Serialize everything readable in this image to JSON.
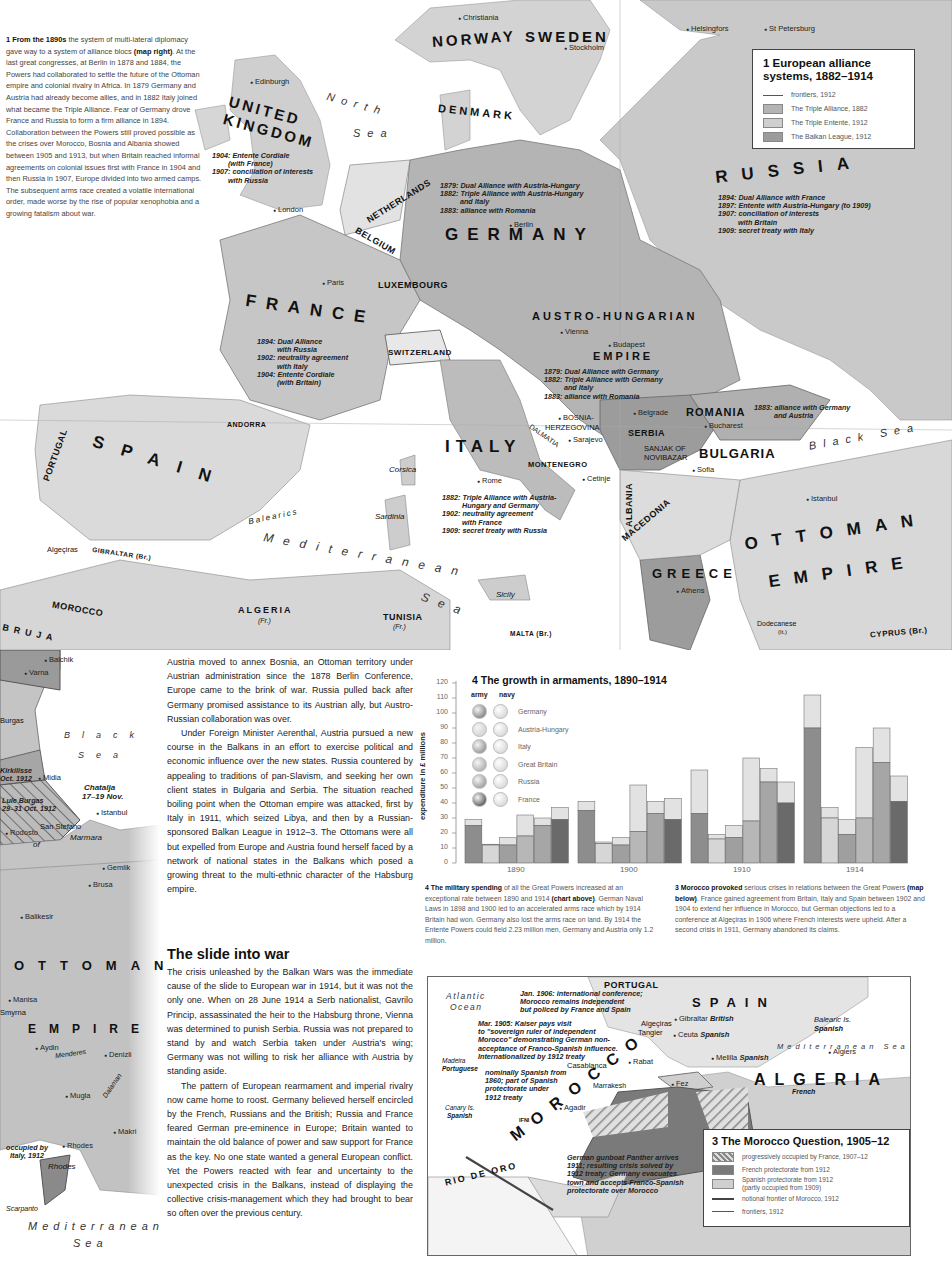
{
  "intro_panel": {
    "lead_bold": "1 From the 1890s",
    "text_1": " the system of multi-lateral diplomacy gave way to a system of alliance blocs ",
    "ref_bold": "(map right)",
    "text_2": ". At the last great congresses, at Berlin in 1878 and 1884, the Powers had collaborated to settle the future of the Ottoman empire and colonial rivalry in Africa. In 1879 Germany and Austria had already become allies, and in 1882 Italy joined what became the Triple Alliance. Fear of Germany drove France and Russia to form a firm alliance in 1894. Collaboration between the Powers still proved possible as the crises over Morocco, Bosnia and Albania showed between 1905 and 1913, but when Britain reached informal agreements on colonial issues first with France in 1904 and then Russia in 1907, Europe divided into two armed camps. The subsequent arms race created a volatile international order, made worse by the rise of popular xenophobia and a growing fatalism about war."
  },
  "map1": {
    "legend": {
      "title_line1": "1 European alliance",
      "title_line2": "systems, 1882–1914",
      "items": [
        {
          "label": "frontiers, 1912",
          "type": "line"
        },
        {
          "label": "The Triple Alliance, 1882",
          "color": "#b4b4b4"
        },
        {
          "label": "The Triple Entente, 1912",
          "color": "#cfcfcf"
        },
        {
          "label": "The Balkan League, 1912",
          "color": "#9c9c9c"
        }
      ]
    },
    "countries": {
      "norway": "NORWAY",
      "sweden": "SWEDEN",
      "denmark": "DENMARK",
      "uk1": "UNITED",
      "uk2": "KINGDOM",
      "netherlands": "NETHERLANDS",
      "belgium": "BELGIUM",
      "luxembourg": "LUXEMBOURG",
      "germany": "GERMANY",
      "russia": "RUSSIA",
      "france": "FRANCE",
      "switzerland": "SWITZERLAND",
      "austria1": "AUSTRO-HUNGARIAN",
      "austria2": "EMPIRE",
      "romania": "ROMANIA",
      "serbia": "SERBIA",
      "bulgaria": "BULGARIA",
      "montenegro": "MONTENEGRO",
      "bosnia1": "BOSNIA-",
      "bosnia2": "HERZEGOVINA",
      "sanjak1": "SANJAK OF",
      "sanjak2": "NOVIBAZAR",
      "dalmatia": "DALMATIA",
      "andorra": "ANDORRA",
      "portugal": "PORTUGAL",
      "spain": "SPAIN",
      "italy": "ITALY",
      "albania": "ALBANIA",
      "macedonia": "MACEDONIA",
      "greece": "GREECE",
      "ottoman1": "OTTOMAN",
      "ottoman2": "EMPIRE",
      "morocco": "MOROCCO",
      "algeria": "ALGERIA",
      "algeria_sub": "(Fr.)",
      "tunisia": "TUNISIA",
      "tunisia_sub": "(Fr.)",
      "gibraltar": "GIBRALTAR (Br.)",
      "malta": "MALTA (Br.)",
      "cyprus": "CYPRUS (Br.)",
      "dodecanese": "Dodecanese",
      "dodecanese_sub": "(It.)"
    },
    "cities": {
      "christiania": "Christiania",
      "stockholm": "Stockholm",
      "helsingfors": "Helsingfors",
      "st_petersburg": "St Petersburg",
      "edinburgh": "Edinburgh",
      "london": "London",
      "paris": "Paris",
      "berlin": "Berlin",
      "vienna": "Vienna",
      "budapest": "Budapest",
      "belgrade": "Belgrade",
      "bucharest": "Bucharest",
      "sarajevo": "Sarajevo",
      "sofia": "Sofia",
      "cetinje": "Cetinje",
      "rome": "Rome",
      "istanbul": "Istanbul",
      "athens": "Athens",
      "algeciras": "Algeçiras"
    },
    "islands": {
      "corsica": "Corsica",
      "sardinia": "Sardinia",
      "sicily": "Sicily",
      "balearics": "Balearics"
    },
    "seas": {
      "north1": "North",
      "north2": "Sea",
      "black": "Black Sea",
      "med1": "Mediterranean",
      "med2": "Sea"
    },
    "notes": {
      "uk": [
        "1904: Entente Cordiale",
        "        (with France)",
        "1907: conciliation of interests",
        "        with Russia"
      ],
      "germany": [
        "1879: Dual Alliance with Austria-Hungary",
        "1882: Triple Alliance with Austria-Hungary",
        "          and Italy",
        "1883: alliance with Romania"
      ],
      "russia": [
        "1894: Dual Alliance with France",
        "1897: Entente with Austria-Hungary (to 1909)",
        "1907: conciliation of interests",
        "          with Britain",
        "1909: secret treaty with Italy"
      ],
      "france": [
        "1894: Dual Alliance",
        "          with Russia",
        "1902: neutrality agreement",
        "          with Italy",
        "1904: Entente Cordiale",
        "          (with Britain)"
      ],
      "austria": [
        "1879: Dual Alliance with Germany",
        "1882: Triple Alliance with Germany",
        "          and Italy",
        "1883: alliance with Romania"
      ],
      "romania": [
        "1883: alliance with Germany",
        "          and Austria"
      ],
      "italy": [
        "1882: Triple Alliance with Austria-",
        "          Hungary and Germany",
        "1902: neutrality agreement",
        "          with France",
        "1909: secret treaty with Russia"
      ]
    }
  },
  "map2": {
    "labels": {
      "dobruja": "BRUJA",
      "balchik": "Balchik",
      "varna": "Varna",
      "burgas": "Burgas",
      "black1": "Black",
      "black2": "Sea",
      "kirkilisse": "Kirkilisse",
      "kirk_date": "Oct. 1912",
      "midia": "Midia",
      "chatalja1": "Chatalja",
      "chatalja2": "17–19 Nov.",
      "lule1": "Lule Burgas",
      "lule2": "29–31 Oct. 1912",
      "rodosto": "Rodosto",
      "san_stefano": "San Stefano",
      "istanbul": "Istanbul",
      "marmara": "Marmara",
      "of": "of",
      "gemlik": "Gemlik",
      "brusa": "Brusa",
      "balikesir": "Balikesir",
      "ottoman": "OTTOMAN",
      "manisa": "Manisa",
      "smyrna": "Smyrna",
      "empire": "EMPIRE",
      "aydin": "Aydin",
      "menderes": "Menderes",
      "denizli": "Denizli",
      "mugla": "Mugla",
      "dalaman": "Dalaman",
      "makri": "Makri",
      "rhodes_town": "Rhodes",
      "rhodes_island": "Rhodes",
      "occ1": "occupied by",
      "occ2": "Italy, 1912",
      "scarpanto": "Scarpanto",
      "med1": "Mediterranean",
      "med2": "Sea"
    }
  },
  "main_text": {
    "p1": "Austria moved to annex Bosnia, an Ottoman territory under Austrian administration since the 1878 Berlin Conference, Europe came to the brink of war. Russia pulled back after Germany promised assistance to its Austrian ally, but Austro-Russian collaboration was over.",
    "p2": "Under Foreign Minister Aerenthal, Austria pursued a new course in the Balkans in an effort to exercise political and economic influence over the new states. Russia countered by appealing to traditions of pan-Slavism, and seeking her own client states in Bulgaria and Serbia. The situation reached boiling point when the Ottoman empire was attacked, first by Italy in 1911, which seized Libya, and then by a Russian-sponsored Balkan League in 1912–3. The Ottomans were all but expelled from Europe and Austria found herself faced by a network of national states in the Balkans which posed a growing threat to the multi-ethnic character of the Habsburg empire.",
    "heading": "The slide into war",
    "p3": "The crisis unleashed by the Balkan Wars was the immediate cause of the slide to European war in 1914, but it was not the only one. When on 28 June 1914 a Serb nationalist, Gavrilo Princip, assassinated the heir to the Habsburg throne, Vienna was determined to punish Serbia. Russia was not prepared to stand by and watch Serbia taken under Austria's wing; Germany was not willing to risk her alliance with Austria by standing aside.",
    "p4": "The pattern of European rearmament and imperial rivalry now came home to roost. Germany believed herself encircled by the French, Russians and the British; Russia and France feared German pre-eminence in Europe; Britain wanted to maintain the old balance of power and saw support for France as the key. No one state wanted a general European conflict. Yet the Powers reacted with fear and uncertainty to the unexpected crisis in the Balkans, instead of displaying the collective crisis-management which they had brought to bear so often over the previous century."
  },
  "chart_data": {
    "type": "bar",
    "title": "4 The growth in armaments, 1890–1914",
    "xlabel": "",
    "ylabel": "expenditure in £ millions",
    "ylim": [
      0,
      120
    ],
    "yticks": [
      0,
      10,
      20,
      30,
      40,
      50,
      60,
      70,
      80,
      90,
      100,
      110,
      120
    ],
    "categories": [
      "1890",
      "1900",
      "1910",
      "1914"
    ],
    "legend_headers": [
      "army",
      "navy"
    ],
    "stacked": true,
    "series": [
      {
        "name": "Germany",
        "army": [
          25,
          35,
          33,
          90
        ],
        "navy": [
          4,
          6,
          29,
          22
        ],
        "total": [
          29,
          41,
          62,
          112
        ],
        "color": "#8d8d8d"
      },
      {
        "name": "Austria-Hungary",
        "army": [
          12,
          13,
          16,
          30
        ],
        "navy": [
          0.5,
          1,
          3,
          7
        ],
        "total": [
          12.5,
          14,
          19,
          37
        ],
        "color": "#d6d6d6"
      },
      {
        "name": "Italy",
        "army": [
          12,
          12,
          17,
          19
        ],
        "navy": [
          5,
          5,
          8,
          10
        ],
        "total": [
          17,
          17,
          25,
          29
        ],
        "color": "#9f9f9f"
      },
      {
        "name": "Great Britain",
        "army": [
          18,
          21,
          28,
          30
        ],
        "navy": [
          14,
          31,
          42,
          47
        ],
        "total": [
          32,
          52,
          70,
          77
        ],
        "color": "#b7b7b7"
      },
      {
        "name": "Russia",
        "army": [
          25,
          33,
          54,
          67
        ],
        "navy": [
          5,
          8,
          9,
          23
        ],
        "total": [
          30,
          41,
          63,
          90
        ],
        "color": "#a6a6a6"
      },
      {
        "name": "France",
        "army": [
          29,
          29,
          40,
          41
        ],
        "navy": [
          8,
          14,
          14,
          17
        ],
        "total": [
          37,
          43,
          54,
          58
        ],
        "color": "#6a6a6a"
      }
    ],
    "grid": false,
    "legend_position": "top-left"
  },
  "chart_caption": {
    "bold": "4 The military spending",
    "text_1": " of all the Great Powers increased at an exceptional rate between 1890 and 1914 ",
    "ref": "(chart above)",
    "text_2": ". German Naval Laws in 1898 and 1900 led to an accelerated arms race which by 1914 Britain had won. Germany also lost the arms race on land. By 1914 the Entente Powers could field 2.23 million men, Germany and Austria only 1.2 million."
  },
  "morocco_caption": {
    "bold": "3 Morocco provoked",
    "text_1": " serious crises in relations between the Great Powers ",
    "ref": "(map below)",
    "text_2": ". France gained agreement from Britain, Italy and Spain between 1902 and 1904 to extend her influence in Morocco, but German objections led to a conference at Algeçiras in 1906 where French interests were upheld. After a second crisis in 1911, Germany abandoned its claims."
  },
  "map3": {
    "legend": {
      "title": "3 The Morocco Question, 1905–12",
      "items": [
        {
          "label": "progressively occupied by France, 1907–12",
          "type": "hatch"
        },
        {
          "label": "French protectorate from 1912",
          "color": "#7a7a7a"
        },
        {
          "label": "Spanish protectorate from 1912",
          "label2": "(partly occupied from 1909)",
          "color": "#cfcfcf"
        },
        {
          "label": "notional frontier of Morocco, 1912",
          "type": "thick-line"
        },
        {
          "label": "frontiers, 1912",
          "type": "line"
        }
      ]
    },
    "labels": {
      "portugal": "PORTUGAL",
      "atlantic1": "Atlantic",
      "atlantic2": "Ocean",
      "spain": "SPAIN",
      "balearic1": "Balearic Is.",
      "balearic2": "Spanish",
      "med": "Mediterranean Sea",
      "gibraltar": "Gibraltar",
      "gibraltar_owner": "British",
      "algeciras": "Algeçiras",
      "tangier": "Tangier",
      "ceuta": "Ceuta",
      "ceuta_owner": "Spanish",
      "melilla": "Melilla",
      "melilla_owner": "Spanish",
      "algiers": "Algiers",
      "madeira1": "Madeira",
      "madeira2": "Portuguese",
      "casablanca": "Casablanca",
      "rabat": "Rabat",
      "fez": "Fez",
      "marrakesh": "Marrakesh",
      "agadir": "Agadir",
      "ifni": "IFNI",
      "canary1": "Canary Is.",
      "canary2": "Spanish",
      "algeria": "ALGERIA",
      "algeria_sub": "French",
      "rio": "RIO DE ORO",
      "morocco": "MOROCCO"
    },
    "notes": {
      "jan1906": [
        "Jan. 1906: international conference;",
        "Morocco remains independent",
        "but policed by France and Spain"
      ],
      "mar1905": [
        "Mar. 1905: Kaiser pays visit",
        "to \"sovereign ruler of independent",
        "Morocco\" demonstrating German non-",
        "acceptance of Franco-Spanish influence.",
        "Internationalized by 1912 treaty"
      ],
      "ifni": [
        "nominally Spanish from",
        "1860; part of Spanish",
        "protectorate under",
        "1912 treaty"
      ],
      "agadir": [
        "German gunboat Panther arrives",
        "1911; resulting crisis solved by",
        "1912 treaty: Germany evacuates",
        "town and accepts Franco-Spanish",
        "protectorate over Morocco"
      ]
    }
  }
}
